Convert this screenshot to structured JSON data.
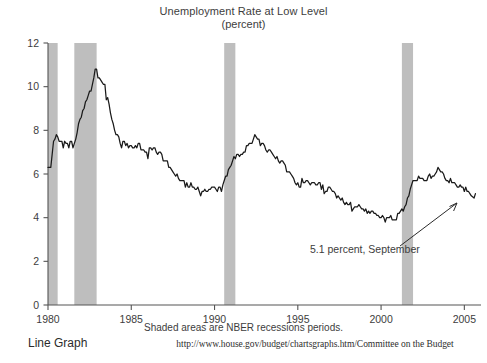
{
  "chart_data": {
    "type": "line",
    "title": "Unemployment Rate at Low Level",
    "subtitle": "(percent)",
    "xlabel": "",
    "ylabel": "",
    "xlim": [
      1980.0,
      2006.0
    ],
    "ylim": [
      0,
      12
    ],
    "grid": false,
    "legend_position": "none",
    "y_ticks": [
      "0",
      "2",
      "4",
      "6",
      "8",
      "10",
      "12"
    ],
    "y_tick_values": [
      0,
      2,
      4,
      6,
      8,
      10,
      12
    ],
    "x_ticks": [
      "1980",
      "1985",
      "1990",
      "1995",
      "2000",
      "2005"
    ],
    "x_tick_values": [
      1980,
      1985,
      1990,
      1995,
      2000,
      2005
    ],
    "footnote": "Shaded areas are NBER recessions periods.",
    "source": "http://www.house.gov/budget/chartsgraphs.htm/Committee on the Budget",
    "graph_kind": "Line Graph",
    "annotation": {
      "text": "5.1 percent, September",
      "value": 5.1,
      "period": "September",
      "arrow": "up-right"
    },
    "line_color": "#1a1a1a",
    "shade_color": "#bebebe",
    "axis_color": "#555555",
    "recessions": [
      {
        "start": 1980.0,
        "end": 1980.58
      },
      {
        "start": 1981.58,
        "end": 1982.92
      },
      {
        "start": 1990.58,
        "end": 1991.25
      },
      {
        "start": 2001.25,
        "end": 2001.92
      }
    ],
    "series": [
      {
        "name": "Unemployment Rate",
        "x": [
          1980.0,
          1980.083,
          1980.167,
          1980.25,
          1980.333,
          1980.417,
          1980.5,
          1980.583,
          1980.667,
          1980.75,
          1980.833,
          1980.917,
          1981.0,
          1981.083,
          1981.167,
          1981.25,
          1981.333,
          1981.417,
          1981.5,
          1981.583,
          1981.667,
          1981.75,
          1981.833,
          1981.917,
          1982.0,
          1982.083,
          1982.167,
          1982.25,
          1982.333,
          1982.417,
          1982.5,
          1982.583,
          1982.667,
          1982.75,
          1982.833,
          1982.917,
          1983.0,
          1983.083,
          1983.167,
          1983.25,
          1983.333,
          1983.417,
          1983.5,
          1983.583,
          1983.667,
          1983.75,
          1983.833,
          1983.917,
          1984.0,
          1984.083,
          1984.167,
          1984.25,
          1984.333,
          1984.417,
          1984.5,
          1984.583,
          1984.667,
          1984.75,
          1984.833,
          1984.917,
          1985.0,
          1985.083,
          1985.167,
          1985.25,
          1985.333,
          1985.417,
          1985.5,
          1985.583,
          1985.667,
          1985.75,
          1985.833,
          1985.917,
          1986.0,
          1986.083,
          1986.167,
          1986.25,
          1986.333,
          1986.417,
          1986.5,
          1986.583,
          1986.667,
          1986.75,
          1986.833,
          1986.917,
          1987.0,
          1987.083,
          1987.167,
          1987.25,
          1987.333,
          1987.417,
          1987.5,
          1987.583,
          1987.667,
          1987.75,
          1987.833,
          1987.917,
          1988.0,
          1988.083,
          1988.167,
          1988.25,
          1988.333,
          1988.417,
          1988.5,
          1988.583,
          1988.667,
          1988.75,
          1988.833,
          1988.917,
          1989.0,
          1989.083,
          1989.167,
          1989.25,
          1989.333,
          1989.417,
          1989.5,
          1989.583,
          1989.667,
          1989.75,
          1989.833,
          1989.917,
          1990.0,
          1990.083,
          1990.167,
          1990.25,
          1990.333,
          1990.417,
          1990.5,
          1990.583,
          1990.667,
          1990.75,
          1990.833,
          1990.917,
          1991.0,
          1991.083,
          1991.167,
          1991.25,
          1991.333,
          1991.417,
          1991.5,
          1991.583,
          1991.667,
          1991.75,
          1991.833,
          1991.917,
          1992.0,
          1992.083,
          1992.167,
          1992.25,
          1992.333,
          1992.417,
          1992.5,
          1992.583,
          1992.667,
          1992.75,
          1992.833,
          1992.917,
          1993.0,
          1993.083,
          1993.167,
          1993.25,
          1993.333,
          1993.417,
          1993.5,
          1993.583,
          1993.667,
          1993.75,
          1993.833,
          1993.917,
          1994.0,
          1994.083,
          1994.167,
          1994.25,
          1994.333,
          1994.417,
          1994.5,
          1994.583,
          1994.667,
          1994.75,
          1994.833,
          1994.917,
          1995.0,
          1995.083,
          1995.167,
          1995.25,
          1995.333,
          1995.417,
          1995.5,
          1995.583,
          1995.667,
          1995.75,
          1995.833,
          1995.917,
          1996.0,
          1996.083,
          1996.167,
          1996.25,
          1996.333,
          1996.417,
          1996.5,
          1996.583,
          1996.667,
          1996.75,
          1996.833,
          1996.917,
          1997.0,
          1997.083,
          1997.167,
          1997.25,
          1997.333,
          1997.417,
          1997.5,
          1997.583,
          1997.667,
          1997.75,
          1997.833,
          1997.917,
          1998.0,
          1998.083,
          1998.167,
          1998.25,
          1998.333,
          1998.417,
          1998.5,
          1998.583,
          1998.667,
          1998.75,
          1998.833,
          1998.917,
          1999.0,
          1999.083,
          1999.167,
          1999.25,
          1999.333,
          1999.417,
          1999.5,
          1999.583,
          1999.667,
          1999.75,
          1999.833,
          1999.917,
          2000.0,
          2000.083,
          2000.167,
          2000.25,
          2000.333,
          2000.417,
          2000.5,
          2000.583,
          2000.667,
          2000.75,
          2000.833,
          2000.917,
          2001.0,
          2001.083,
          2001.167,
          2001.25,
          2001.333,
          2001.417,
          2001.5,
          2001.583,
          2001.667,
          2001.75,
          2001.833,
          2001.917,
          2002.0,
          2002.083,
          2002.167,
          2002.25,
          2002.333,
          2002.417,
          2002.5,
          2002.583,
          2002.667,
          2002.75,
          2002.833,
          2002.917,
          2003.0,
          2003.083,
          2003.167,
          2003.25,
          2003.333,
          2003.417,
          2003.5,
          2003.583,
          2003.667,
          2003.75,
          2003.833,
          2003.917,
          2004.0,
          2004.083,
          2004.167,
          2004.25,
          2004.333,
          2004.417,
          2004.5,
          2004.583,
          2004.667,
          2004.75,
          2004.833,
          2004.917,
          2005.0,
          2005.083,
          2005.167,
          2005.25,
          2005.333,
          2005.417,
          2005.583,
          2005.667
        ],
        "values": [
          6.3,
          6.3,
          6.3,
          6.9,
          7.5,
          7.6,
          7.8,
          7.7,
          7.5,
          7.5,
          7.5,
          7.2,
          7.5,
          7.4,
          7.4,
          7.2,
          7.5,
          7.5,
          7.2,
          7.4,
          7.6,
          7.9,
          8.3,
          8.5,
          8.6,
          8.9,
          9.0,
          9.3,
          9.4,
          9.6,
          9.8,
          9.8,
          10.1,
          10.4,
          10.8,
          10.8,
          10.4,
          10.4,
          10.3,
          10.2,
          10.1,
          10.1,
          9.4,
          9.5,
          9.2,
          8.8,
          8.5,
          8.3,
          8.0,
          7.8,
          7.8,
          7.7,
          7.4,
          7.2,
          7.5,
          7.5,
          7.3,
          7.4,
          7.2,
          7.3,
          7.3,
          7.2,
          7.2,
          7.3,
          7.2,
          7.4,
          7.4,
          7.1,
          7.1,
          7.1,
          7.0,
          7.0,
          6.7,
          7.2,
          7.2,
          7.1,
          7.2,
          7.2,
          7.0,
          6.9,
          7.0,
          7.0,
          6.9,
          6.6,
          6.6,
          6.6,
          6.6,
          6.3,
          6.3,
          6.2,
          6.1,
          6.0,
          5.9,
          6.0,
          5.8,
          5.7,
          5.7,
          5.7,
          5.7,
          5.4,
          5.6,
          5.4,
          5.4,
          5.6,
          5.4,
          5.4,
          5.3,
          5.3,
          5.4,
          5.2,
          5.0,
          5.2,
          5.2,
          5.3,
          5.2,
          5.2,
          5.3,
          5.3,
          5.4,
          5.4,
          5.4,
          5.3,
          5.2,
          5.4,
          5.4,
          5.2,
          5.5,
          5.7,
          5.9,
          5.9,
          6.2,
          6.3,
          6.4,
          6.6,
          6.8,
          6.7,
          6.9,
          6.9,
          6.8,
          6.9,
          6.9,
          7.0,
          7.0,
          7.3,
          7.3,
          7.4,
          7.4,
          7.4,
          7.6,
          7.8,
          7.7,
          7.6,
          7.6,
          7.3,
          7.4,
          7.4,
          7.3,
          7.1,
          7.0,
          7.1,
          7.1,
          7.0,
          6.9,
          6.8,
          6.7,
          6.8,
          6.6,
          6.5,
          6.6,
          6.6,
          6.5,
          6.4,
          6.1,
          6.1,
          6.1,
          6.0,
          5.9,
          5.8,
          5.6,
          5.5,
          5.6,
          5.4,
          5.4,
          5.8,
          5.6,
          5.6,
          5.7,
          5.7,
          5.6,
          5.5,
          5.6,
          5.6,
          5.6,
          5.5,
          5.5,
          5.6,
          5.6,
          5.3,
          5.5,
          5.1,
          5.2,
          5.2,
          5.4,
          5.4,
          5.3,
          5.2,
          5.2,
          5.1,
          4.9,
          5.0,
          4.9,
          4.8,
          4.9,
          4.7,
          4.6,
          4.7,
          4.6,
          4.6,
          4.7,
          4.3,
          4.4,
          4.5,
          4.5,
          4.5,
          4.6,
          4.5,
          4.4,
          4.4,
          4.3,
          4.4,
          4.2,
          4.3,
          4.2,
          4.3,
          4.3,
          4.2,
          4.2,
          4.1,
          4.1,
          4.0,
          4.0,
          4.1,
          4.0,
          3.8,
          4.0,
          4.0,
          4.0,
          4.1,
          3.9,
          3.9,
          3.9,
          3.9,
          4.2,
          4.2,
          4.3,
          4.4,
          4.3,
          4.5,
          4.6,
          4.9,
          5.0,
          5.3,
          5.5,
          5.7,
          5.7,
          5.7,
          5.7,
          5.9,
          5.8,
          5.8,
          5.8,
          5.7,
          5.7,
          5.7,
          5.9,
          6.0,
          5.8,
          5.9,
          5.9,
          6.0,
          6.1,
          6.3,
          6.2,
          6.1,
          6.1,
          6.0,
          5.8,
          5.7,
          5.7,
          5.6,
          5.8,
          5.6,
          5.6,
          5.6,
          5.5,
          5.4,
          5.4,
          5.5,
          5.4,
          5.4,
          5.2,
          5.4,
          5.2,
          5.2,
          5.1,
          5.0,
          4.9,
          5.1
        ]
      }
    ]
  }
}
